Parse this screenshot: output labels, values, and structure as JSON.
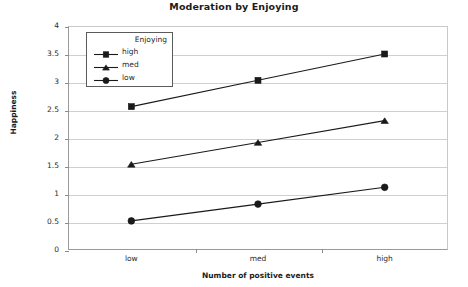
{
  "chart_data": {
    "type": "line",
    "title": "Moderation by Enjoying",
    "xlabel": "Number of positive events",
    "ylabel": "Happiness",
    "categories": [
      "low",
      "med",
      "high"
    ],
    "ylim": [
      0,
      4
    ],
    "yticks": [
      "0",
      "0.5",
      "1",
      "1.5",
      "2",
      "2.5",
      "3",
      "3.5",
      "4"
    ],
    "ytick_values": [
      0,
      0.5,
      1,
      1.5,
      2,
      2.5,
      3,
      3.5,
      4
    ],
    "grid": true,
    "legend_position": "upper left inside",
    "legend_title": "Enjoying",
    "series": [
      {
        "name": "high",
        "marker": "square",
        "values": [
          2.56,
          3.03,
          3.5
        ]
      },
      {
        "name": "med",
        "marker": "triangle",
        "values": [
          1.53,
          1.92,
          2.31
        ]
      },
      {
        "name": "low",
        "marker": "circle",
        "values": [
          0.52,
          0.82,
          1.12
        ]
      }
    ],
    "line_color": "#1a1a1a",
    "grid_color": "#cfcfcf",
    "background": "#ffffff"
  }
}
